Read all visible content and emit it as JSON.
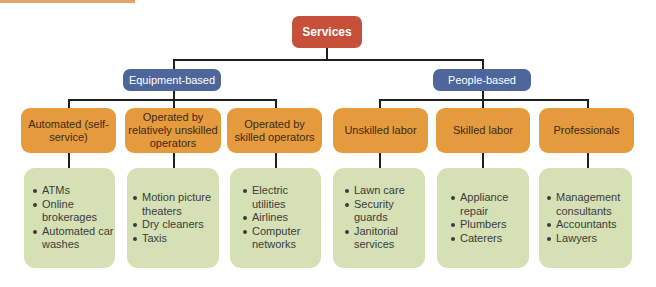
{
  "diagram": {
    "root": {
      "label": "Services",
      "color": "#c7503a"
    },
    "groups": [
      {
        "label": "Equipment-based",
        "color": "#4d679d",
        "categories": [
          {
            "label": "Automated (self-service)",
            "items": [
              "ATMs",
              "Online brokerages",
              "Automated car washes"
            ]
          },
          {
            "label": "Operated by relatively unskilled operators",
            "items": [
              "Motion picture theaters",
              "Dry cleaners",
              "Taxis"
            ]
          },
          {
            "label": "Operated by skilled operators",
            "items": [
              "Electric utilities",
              "Airlines",
              "Computer networks"
            ]
          }
        ]
      },
      {
        "label": "People-based",
        "color": "#4d679d",
        "categories": [
          {
            "label": "Unskilled labor",
            "items": [
              "Lawn care",
              "Security guards",
              "Janitorial services"
            ]
          },
          {
            "label": "Skilled labor",
            "items": [
              "Appliance repair",
              "Plumbers",
              "Caterers"
            ]
          },
          {
            "label": "Professionals",
            "items": [
              "Management consultants",
              "Accountants",
              "Lawyers"
            ]
          }
        ]
      }
    ],
    "colors": {
      "category": "#e59b3d",
      "examples": "#d5e1b4",
      "connector": "#1f1f1f"
    }
  }
}
